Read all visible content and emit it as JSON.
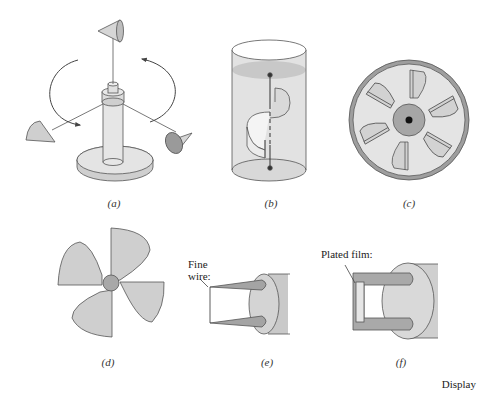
{
  "figure": {
    "panels": [
      {
        "id": "a",
        "caption": "(a)",
        "depicts": "cup anemometer"
      },
      {
        "id": "b",
        "caption": "(b)",
        "depicts": "Savonius rotor in cylinder"
      },
      {
        "id": "c",
        "caption": "(c)",
        "depicts": "turbine flowmeter (end view)"
      },
      {
        "id": "d",
        "caption": "(d)",
        "depicts": "four-blade propeller"
      },
      {
        "id": "e",
        "caption": "(e)",
        "depicts": "hot-wire probe"
      },
      {
        "id": "f",
        "caption": "(f)",
        "depicts": "hot-film probe"
      }
    ],
    "annotations": {
      "fine_wire": [
        "Fine",
        "wire:"
      ],
      "plated_film": "Plated film:"
    },
    "footer": "Display",
    "colors": {
      "fill_light": "#e3e3e3",
      "fill_mid": "#c9c9c9",
      "fill_dark": "#9a9a9a",
      "stroke": "#555555",
      "hub_dark": "#111111"
    }
  }
}
